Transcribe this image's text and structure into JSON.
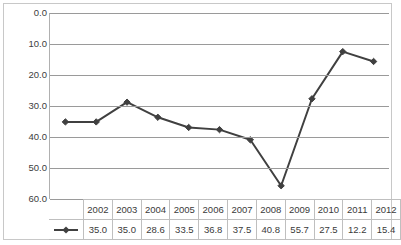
{
  "chart_data": {
    "type": "line",
    "title": "",
    "xlabel": "",
    "ylabel": "",
    "categories": [
      "2002",
      "2003",
      "2004",
      "2005",
      "2006",
      "2007",
      "2008",
      "2009",
      "2010",
      "2011",
      "2012"
    ],
    "values": [
      35.0,
      35.0,
      28.6,
      33.5,
      36.8,
      37.5,
      40.8,
      55.7,
      27.5,
      12.2,
      15.4
    ],
    "series": [
      {
        "name": "",
        "values": [
          35.0,
          35.0,
          28.6,
          33.5,
          36.8,
          37.5,
          40.8,
          55.7,
          27.5,
          12.2,
          15.4
        ]
      }
    ],
    "ylim": [
      0.0,
      60.0
    ],
    "y_inverted": true,
    "y_ticks": [
      "0.0",
      "10.0",
      "20.0",
      "30.0",
      "40.0",
      "50.0",
      "60.0"
    ],
    "y_tick_values": [
      0.0,
      10.0,
      20.0,
      30.0,
      40.0,
      50.0,
      60.0
    ],
    "grid": true,
    "legend_position": "data-table-row",
    "marker": "diamond",
    "line_color": "#404040",
    "marker_color": "#404040",
    "gridline_color": "#9a9a9a",
    "border_color": "#c8c8c8",
    "text_color": "#404040",
    "data_table": {
      "header_row": [
        "2002",
        "2003",
        "2004",
        "2005",
        "2006",
        "2007",
        "2008",
        "2009",
        "2010",
        "2011",
        "2012"
      ],
      "value_row": [
        "35.0",
        "35.0",
        "28.6",
        "33.5",
        "36.8",
        "37.5",
        "40.8",
        "55.7",
        "27.5",
        "12.2",
        "15.4"
      ],
      "legend_marker": "line-with-diamond-marker"
    }
  }
}
